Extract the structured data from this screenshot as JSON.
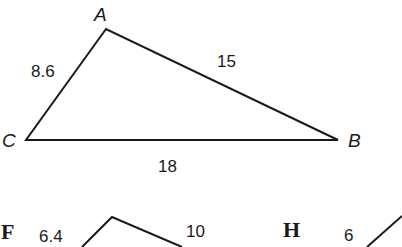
{
  "main_triangle": {
    "vertices": {
      "A": "A",
      "B": "B",
      "C": "C"
    },
    "sides": {
      "CA": "8.6",
      "AB": "15",
      "CB": "18"
    }
  },
  "options": [
    {
      "letter": "F",
      "sides": {
        "left": "6.4",
        "right": "10"
      }
    },
    {
      "letter": "H",
      "sides": {
        "left": "6"
      }
    }
  ],
  "colors": {
    "stroke": "#1a1a1a",
    "background": "#ffffff"
  }
}
